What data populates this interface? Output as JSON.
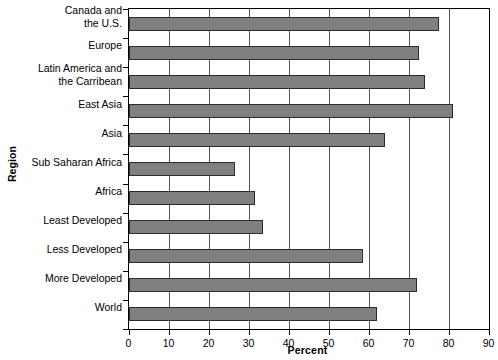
{
  "chart_data": {
    "type": "bar",
    "orientation": "horizontal",
    "title": "",
    "xlabel": "Percent",
    "ylabel": "Region",
    "xlim": [
      0,
      90
    ],
    "xticks": [
      0,
      10,
      20,
      30,
      40,
      50,
      60,
      70,
      80,
      90
    ],
    "grid": true,
    "legend": "none",
    "bar_color": "#808080",
    "bar_edge_color": "#2b2b2b",
    "categories": [
      "Canada and\nthe U.S.",
      "Europe",
      "Latin America and\nthe Carribean",
      "East Asia",
      "Asia",
      "Sub Saharan Africa",
      "Africa",
      "Least Developed",
      "Less Developed",
      "More Developed",
      "World"
    ],
    "values": [
      77.5,
      72.5,
      74,
      81,
      64,
      26.5,
      31.5,
      33.5,
      58.5,
      72,
      62
    ]
  }
}
